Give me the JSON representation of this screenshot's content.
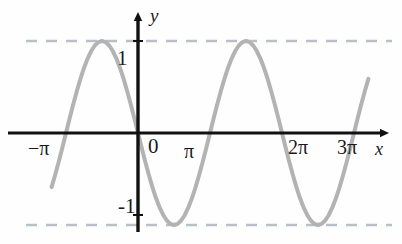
{
  "figure": {
    "background_color": "#fefefe"
  },
  "axes": {
    "x_axis_label": "x",
    "y_axis_label": "y",
    "axis_color": "#111111",
    "arrow_style": "solid-triangle"
  },
  "labels": {
    "y_tick_pos": "1",
    "y_tick_neg": "-1",
    "x_tick_minus_pi": "−π",
    "x_tick_zero": "0",
    "x_tick_pi": "π",
    "x_tick_two_pi": "2π",
    "x_tick_three_pi": "3π"
  },
  "guides": {
    "color": "#b9bfc6",
    "style": "dashed",
    "values": [
      1,
      -1
    ]
  },
  "chart_data": {
    "type": "line",
    "title": "",
    "subtitle": "",
    "xlabel": "x",
    "ylabel": "y",
    "function": "y = sin(x)",
    "curve_color": "#b3b3b3",
    "curve_width": 4,
    "grid": false,
    "legend": null,
    "xlim": [
      -3.7699,
      11.3097
    ],
    "ylim": [
      -1.55,
      1.55
    ],
    "xtick_values": [
      -3.14159,
      0,
      3.14159,
      6.28319,
      9.42478
    ],
    "xtick_labels": [
      "−π",
      "0",
      "π",
      "2π",
      "3π"
    ],
    "ytick_values": [
      1,
      -1
    ],
    "ytick_labels": [
      "1",
      "-1"
    ],
    "guide_lines_y": [
      1,
      -1
    ],
    "key_points": {
      "zeros": [
        -3.14159,
        0,
        3.14159,
        6.28319,
        9.42478
      ],
      "maxima": [
        {
          "x": 1.5708,
          "y": 1
        },
        {
          "x": 7.85398,
          "y": 1
        }
      ],
      "minima": [
        {
          "x": -1.5708,
          "y": -1
        },
        {
          "x": 4.71239,
          "y": -1
        }
      ]
    },
    "x": [
      -3.7699,
      -3.6128,
      -3.4558,
      -3.2987,
      -3.1416,
      -2.9845,
      -2.8274,
      -2.6704,
      -2.5133,
      -2.3562,
      -2.1991,
      -2.042,
      -1.885,
      -1.7279,
      -1.5708,
      -1.4137,
      -1.2566,
      -1.0996,
      -0.9425,
      -0.7854,
      -0.6283,
      -0.4712,
      -0.3142,
      -0.1571,
      0,
      0.1571,
      0.3142,
      0.4712,
      0.6283,
      0.7854,
      0.9425,
      1.0996,
      1.2566,
      1.4137,
      1.5708,
      1.7279,
      1.885,
      2.042,
      2.1991,
      2.3562,
      2.5133,
      2.6704,
      2.8274,
      2.9845,
      3.1416,
      3.2987,
      3.4558,
      3.6128,
      3.7699,
      3.927,
      4.0841,
      4.2412,
      4.3982,
      4.5553,
      4.7124,
      4.8695,
      5.0265,
      5.1836,
      5.3407,
      5.4978,
      5.6549,
      5.8119,
      5.969,
      6.1261,
      6.2832,
      6.4403,
      6.5973,
      6.7544,
      6.9115,
      7.0686,
      7.2257,
      7.3827,
      7.5398,
      7.6969,
      7.854,
      8.011,
      8.1681,
      8.3252,
      8.4823,
      8.6394,
      8.7964,
      8.9535,
      9.1106,
      9.2677,
      9.4248,
      9.5819,
      9.7389,
      9.896,
      10.0531
    ],
    "y": [
      -0.5878,
      -0.454,
      -0.309,
      -0.1564,
      0,
      0.1564,
      0.309,
      0.454,
      0.5878,
      0.7071,
      0.809,
      0.891,
      0.951,
      0.9877,
      1,
      0.9877,
      0.951,
      0.891,
      0.809,
      0.7071,
      0.5878,
      0.454,
      0.309,
      0.1564,
      0,
      -0.1564,
      -0.309,
      -0.454,
      -0.5878,
      -0.7071,
      -0.809,
      -0.891,
      -0.951,
      -0.9877,
      -1,
      -0.9877,
      -0.951,
      -0.891,
      -0.809,
      -0.7071,
      -0.5878,
      -0.454,
      -0.309,
      -0.1564,
      0,
      0.1564,
      0.309,
      0.454,
      0.5878,
      0.7071,
      0.809,
      0.891,
      0.951,
      0.9877,
      1,
      0.9877,
      0.951,
      0.891,
      0.809,
      0.7071,
      0.5878,
      0.454,
      0.309,
      0.1564,
      0,
      -0.1564,
      -0.309,
      -0.454,
      -0.5878,
      -0.7071,
      -0.809,
      -0.891,
      -0.951,
      -0.9877,
      -1,
      -0.9877,
      -0.951,
      -0.891,
      -0.809,
      -0.7071,
      -0.5878,
      -0.454,
      -0.309,
      -0.1564,
      0,
      0.1564,
      0.309,
      0.454,
      0.5878
    ]
  }
}
